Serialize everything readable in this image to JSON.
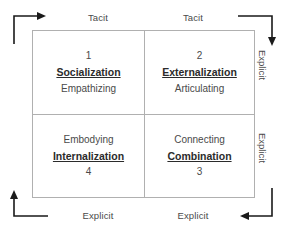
{
  "diagram": {
    "axes": {
      "top_left": "Tacit",
      "top_right": "Tacit",
      "bottom_left": "Explicit",
      "bottom_right": "Explicit",
      "right_top": "Explicit",
      "right_bottom": "Explicit"
    },
    "quadrants": [
      {
        "number": "1",
        "mode": "Socialization",
        "action": "Empathizing",
        "position": "top-left",
        "order": [
          "number",
          "mode",
          "action"
        ]
      },
      {
        "number": "2",
        "mode": "Externalization",
        "action": "Articulating",
        "position": "top-right",
        "order": [
          "number",
          "mode",
          "action"
        ]
      },
      {
        "number": "4",
        "mode": "Internalization",
        "action": "Embodying",
        "position": "bottom-left",
        "order": [
          "action",
          "mode",
          "number"
        ]
      },
      {
        "number": "3",
        "mode": "Combination",
        "action": "Connecting",
        "position": "bottom-right",
        "order": [
          "action",
          "mode",
          "number"
        ]
      }
    ],
    "arrows": [
      {
        "name": "flow-arrow-top-left",
        "direction": "right",
        "corner": "top-left"
      },
      {
        "name": "flow-arrow-top-right",
        "direction": "down",
        "corner": "top-right"
      },
      {
        "name": "flow-arrow-bottom-left",
        "direction": "up",
        "corner": "bottom-left"
      },
      {
        "name": "flow-arrow-bottom-right",
        "direction": "left",
        "corner": "bottom-right"
      }
    ],
    "colors": {
      "background": "#ffffff",
      "border": "#b0b0b0",
      "text": "#4a4a4a",
      "mode_text": "#2b2b2b",
      "arrow": "#1a1a1a"
    }
  }
}
